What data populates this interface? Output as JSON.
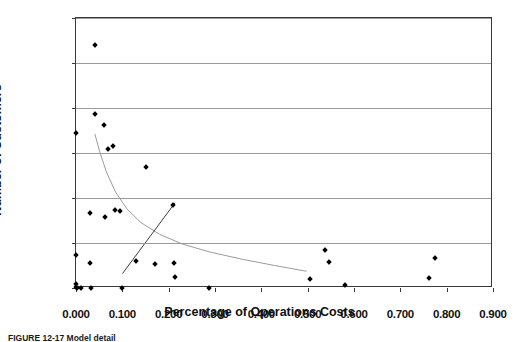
{
  "chart_data": {
    "type": "scatter",
    "title": "",
    "xlabel": "Percentage of Operations Costs",
    "ylabel": "Number of Customers",
    "xlim": [
      0.0,
      0.9
    ],
    "ylim": [
      0,
      60000
    ],
    "xticks": [
      "0.000",
      "0.100",
      "0.200",
      "0.300",
      "0.400",
      "0.500",
      "0.600",
      "0.700",
      "0.800",
      "0.900"
    ],
    "xtick_values": [
      0.0,
      0.1,
      0.2,
      0.3,
      0.4,
      0.5,
      0.6,
      0.7,
      0.8,
      0.9
    ],
    "yticks": [
      "0",
      "10,000",
      "20,000",
      "30,000",
      "40,000",
      "50,000",
      "60,000"
    ],
    "ytick_values": [
      0,
      10000,
      20000,
      30000,
      40000,
      50000,
      60000
    ],
    "grid": "horizontal",
    "legend": "none",
    "marker": "diamond",
    "marker_color": "#000000",
    "points": [
      {
        "x": 0.0,
        "y": 34500
      },
      {
        "x": 0.0,
        "y": 7300
      },
      {
        "x": 0.0,
        "y": 900
      },
      {
        "x": 0.0,
        "y": 300
      },
      {
        "x": 0.003,
        "y": 0
      },
      {
        "x": 0.01,
        "y": 0
      },
      {
        "x": 0.03,
        "y": 16600
      },
      {
        "x": 0.03,
        "y": 5600
      },
      {
        "x": 0.032,
        "y": 0
      },
      {
        "x": 0.04,
        "y": 53900
      },
      {
        "x": 0.042,
        "y": 38700
      },
      {
        "x": 0.06,
        "y": 36200
      },
      {
        "x": 0.063,
        "y": 15800
      },
      {
        "x": 0.07,
        "y": 31000
      },
      {
        "x": 0.08,
        "y": 31600
      },
      {
        "x": 0.085,
        "y": 17300
      },
      {
        "x": 0.095,
        "y": 17100
      },
      {
        "x": 0.1,
        "y": 0
      },
      {
        "x": 0.13,
        "y": 6100
      },
      {
        "x": 0.15,
        "y": 26800
      },
      {
        "x": 0.17,
        "y": 5400
      },
      {
        "x": 0.21,
        "y": 18500
      },
      {
        "x": 0.212,
        "y": 5500
      },
      {
        "x": 0.213,
        "y": 2400
      },
      {
        "x": 0.288,
        "y": 0
      },
      {
        "x": 0.505,
        "y": 2000
      },
      {
        "x": 0.537,
        "y": 8500
      },
      {
        "x": 0.545,
        "y": 5800
      },
      {
        "x": 0.58,
        "y": 700
      },
      {
        "x": 0.762,
        "y": 2300
      },
      {
        "x": 0.775,
        "y": 6600
      }
    ],
    "trend_lines": [
      {
        "name": "power-decay-curve",
        "color": "#9a9a9a",
        "width": 1,
        "path": [
          {
            "x": 0.04,
            "y": 34000
          },
          {
            "x": 0.05,
            "y": 30200
          },
          {
            "x": 0.065,
            "y": 25500
          },
          {
            "x": 0.085,
            "y": 21000
          },
          {
            "x": 0.11,
            "y": 17200
          },
          {
            "x": 0.14,
            "y": 14200
          },
          {
            "x": 0.18,
            "y": 11600
          },
          {
            "x": 0.23,
            "y": 9400
          },
          {
            "x": 0.29,
            "y": 7600
          },
          {
            "x": 0.36,
            "y": 6000
          },
          {
            "x": 0.43,
            "y": 4600
          },
          {
            "x": 0.5,
            "y": 3300
          }
        ]
      },
      {
        "name": "rising-regression-line",
        "color": "#3a3a3a",
        "width": 1,
        "path": [
          {
            "x": 0.1,
            "y": 2800
          },
          {
            "x": 0.214,
            "y": 18600
          }
        ]
      }
    ]
  },
  "caption": {
    "text": "FIGURE 12-17   Model detail"
  }
}
